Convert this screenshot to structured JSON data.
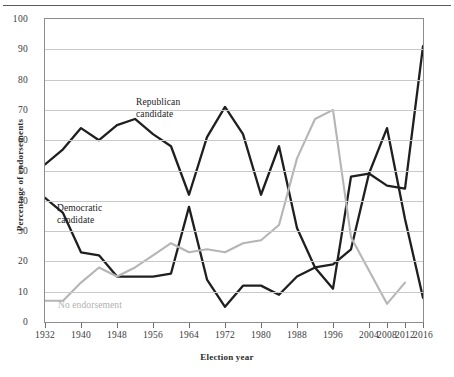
{
  "figure": {
    "has_top_rule": true,
    "background": "#ffffff"
  },
  "axes": {
    "ylabel": "Percentage of endorsements",
    "xlabel": "Election year",
    "yticks": [
      0,
      10,
      20,
      30,
      40,
      50,
      60,
      70,
      80,
      90,
      100
    ],
    "xticks": [
      1932,
      1940,
      1948,
      1956,
      1964,
      1972,
      1980,
      1988,
      1996,
      2004,
      2008,
      2012,
      2016
    ],
    "ylim": [
      0,
      100
    ],
    "xlim": [
      1932,
      2016
    ],
    "grid": "horizontal"
  },
  "annotations": {
    "republican": "Republican\ncandidate",
    "democratic": "Democratic\ncandidate",
    "no_endorsement": "No endorsement"
  },
  "colors": {
    "republican": "#1f1f1f",
    "democratic": "#1f1f1f",
    "no_endorsement": "#b5b5b5",
    "gridline": "#c9c9c9",
    "frame": "#8d8d8d",
    "tick_text": "#3a3a3a",
    "axis_title": "#2b2b2b"
  },
  "chart_data": {
    "type": "line",
    "title": "",
    "xlabel": "Election year",
    "ylabel": "Percentage of endorsements",
    "ylim": [
      0,
      100
    ],
    "xlim": [
      1932,
      2016
    ],
    "grid": true,
    "legend_position": "inline-annotation",
    "x": [
      1932,
      1936,
      1940,
      1944,
      1948,
      1952,
      1956,
      1960,
      1964,
      1968,
      1972,
      1976,
      1980,
      1984,
      1988,
      1992,
      1996,
      2000,
      2004,
      2008,
      2012,
      2016
    ],
    "series": [
      {
        "name": "Republican candidate",
        "color": "#1f1f1f",
        "values": [
          52,
          57,
          64,
          60,
          65,
          67,
          62,
          58,
          42,
          61,
          71,
          62,
          42,
          58,
          31,
          18,
          11,
          48,
          49,
          64,
          34,
          8
        ]
      },
      {
        "name": "Democratic candidate",
        "color": "#1f1f1f",
        "values": [
          41,
          36,
          23,
          22,
          15,
          15,
          15,
          16,
          38,
          14,
          5,
          12,
          12,
          9,
          15,
          18,
          19,
          24,
          49,
          45,
          44,
          91
        ]
      },
      {
        "name": "No endorsement",
        "color": "#b5b5b5",
        "values": [
          7,
          7,
          13,
          18,
          15,
          18,
          22,
          26,
          23,
          24,
          23,
          26,
          27,
          32,
          54,
          67,
          70,
          28,
          17,
          6,
          13,
          null
        ]
      }
    ]
  }
}
